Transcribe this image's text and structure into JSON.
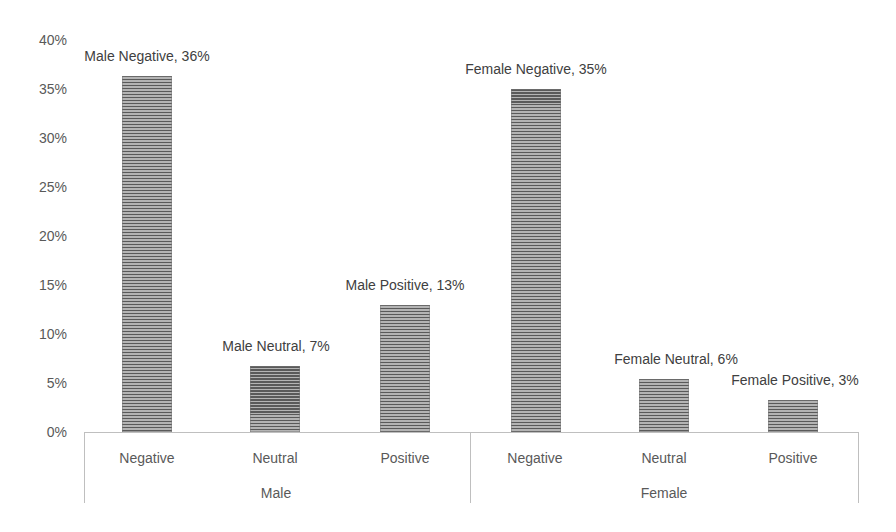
{
  "chart_data": {
    "type": "bar",
    "title": "",
    "xlabel": "",
    "ylabel": "",
    "ylim": [
      0,
      0.4
    ],
    "yticks": [
      "0%",
      "5%",
      "10%",
      "15%",
      "20%",
      "25%",
      "30%",
      "35%",
      "40%"
    ],
    "grid": false,
    "legend": "none",
    "groups": [
      {
        "name": "Male",
        "categories": [
          "Negative",
          "Neutral",
          "Positive"
        ]
      },
      {
        "name": "Female",
        "categories": [
          "Negative",
          "Neutral",
          "Positive"
        ]
      }
    ],
    "categories": [
      "Male Negative",
      "Male Neutral",
      "Male Positive",
      "Female Negative",
      "Female Neutral",
      "Female Positive"
    ],
    "values": [
      0.36,
      0.07,
      0.13,
      0.35,
      0.06,
      0.03
    ],
    "bars": [
      {
        "group": "Male",
        "category": "Negative",
        "value": 0.363,
        "label": "Male Negative, 36%"
      },
      {
        "group": "Male",
        "category": "Neutral",
        "value": 0.067,
        "label": "Male Neutral, 7%"
      },
      {
        "group": "Male",
        "category": "Positive",
        "value": 0.13,
        "label": "Male Positive, 13%"
      },
      {
        "group": "Female",
        "category": "Negative",
        "value": 0.35,
        "label": "Female Negative, 35%"
      },
      {
        "group": "Female",
        "category": "Neutral",
        "value": 0.054,
        "label": "Female Neutral, 6%"
      },
      {
        "group": "Female",
        "category": "Positive",
        "value": 0.033,
        "label": "Female Positive, 3%"
      }
    ],
    "bar_fill": "horizontal-stripes",
    "colors": {
      "bar_dark": "#5a5a5a",
      "bar_light": "#b4b4b4",
      "axis": "#bfbfbf",
      "text": "#595959"
    }
  }
}
